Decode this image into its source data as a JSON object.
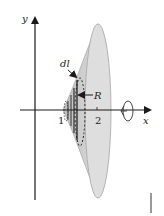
{
  "figure": {
    "axes": {
      "x_label": "x",
      "y_label": "y",
      "x_ticks": [
        "1",
        "2"
      ]
    },
    "annotations": {
      "element_label": "dl",
      "radius_label": "R"
    },
    "colors": {
      "surface_fill": "#d9d9d9",
      "surface_inner": "#c4c4c4",
      "axis": "#1a1a1a",
      "text": "#222222"
    },
    "rotation_symbol": "rotation-about-x-axis"
  }
}
